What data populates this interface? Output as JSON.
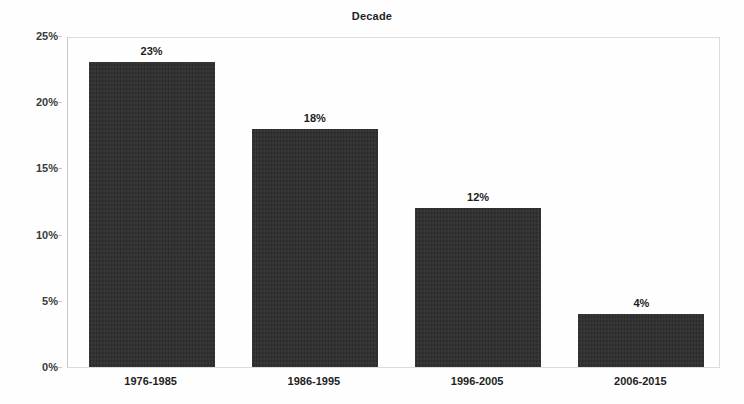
{
  "chart_data": {
    "type": "bar",
    "title": "Decade",
    "xlabel": "",
    "ylabel": "Jobs Created",
    "categories": [
      "1976-1985",
      "1986-1995",
      "1996-2005",
      "2006-2015"
    ],
    "values": [
      23,
      18,
      12,
      4
    ],
    "value_labels": [
      "23%",
      "18%",
      "12%",
      "4%"
    ],
    "ylim": [
      0,
      25
    ],
    "ytick_values": [
      0,
      5,
      10,
      15,
      20,
      25
    ],
    "ytick_labels": [
      "0%",
      "5%",
      "10%",
      "15%",
      "20%",
      "25%"
    ],
    "grid": false,
    "legend": null,
    "bar_color": "#2e2e2e",
    "plot_border_color": "#dcdcdc",
    "background_color": "#ffffff"
  }
}
